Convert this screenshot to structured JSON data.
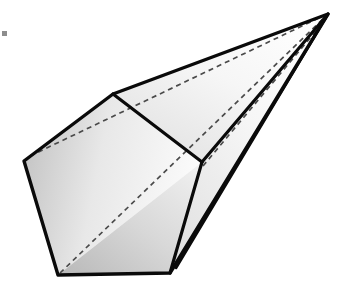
{
  "figure": {
    "background_color": "#ffffff",
    "stroke_color": "#000000",
    "hidden_edge_color": "#4a4a4a",
    "fill_light": "#fefefe",
    "fill_mid": "#e2e2e2",
    "fill_dark": "#c9c9c9",
    "stroke_width": 3,
    "hidden_stroke_width": 1.6,
    "hidden_dash_pattern": "5,4",
    "vertices": {
      "apex": [
        328,
        14
      ],
      "ridge_bend": [
        113,
        94
      ],
      "mid_right": [
        202,
        162
      ],
      "left_corner": [
        24,
        161
      ],
      "bottom_left": [
        58,
        275
      ],
      "bottom_right": [
        170,
        273
      ],
      "upper_left_dash": [
        30,
        154
      ],
      "sliver_tip": [
        176,
        268
      ]
    },
    "faces": [
      {
        "name": "top-left-face",
        "points": "113,94 24,161 30,154 113,94",
        "shade": "mid"
      },
      {
        "name": "upper-long-face",
        "points": "328,14 113,94 202,162",
        "shade": "light"
      },
      {
        "name": "left-quad-face",
        "points": "24,161 113,94 202,162 58,275",
        "shade": "mid"
      },
      {
        "name": "bottom-face",
        "points": "58,275 202,162 170,273",
        "shade": "dark"
      },
      {
        "name": "right-long-face",
        "points": "202,162 328,14 170,273",
        "shade": "light"
      },
      {
        "name": "right-sliver-face",
        "points": "170,273 328,14 176,268",
        "shade": "mid"
      }
    ],
    "solid_edges": [
      {
        "name": "apex-to-ridge-bend",
        "from": [
          328,
          14
        ],
        "to": [
          113,
          94
        ]
      },
      {
        "name": "ridge-bend-to-left-corner",
        "from": [
          113,
          94
        ],
        "to": [
          24,
          161
        ]
      },
      {
        "name": "left-corner-to-bottom-left",
        "from": [
          24,
          161
        ],
        "to": [
          58,
          275
        ]
      },
      {
        "name": "bottom-left-to-bottom-right",
        "from": [
          58,
          275
        ],
        "to": [
          170,
          273
        ]
      },
      {
        "name": "ridge-bend-to-mid-right",
        "from": [
          113,
          94
        ],
        "to": [
          202,
          162
        ]
      },
      {
        "name": "mid-right-to-bottom-right",
        "from": [
          202,
          162
        ],
        "to": [
          170,
          273
        ]
      },
      {
        "name": "mid-right-to-apex",
        "from": [
          202,
          162
        ],
        "to": [
          328,
          14
        ]
      },
      {
        "name": "bottom-right-to-apex",
        "from": [
          170,
          273
        ],
        "to": [
          328,
          14
        ]
      },
      {
        "name": "sliver-tip-to-apex",
        "from": [
          176,
          268
        ],
        "to": [
          328,
          14
        ]
      }
    ],
    "hidden_edges": [
      {
        "name": "left-corner-to-apex-hidden",
        "from": [
          30,
          155
        ],
        "to": [
          328,
          14
        ]
      },
      {
        "name": "bottom-left-to-apex-hidden",
        "from": [
          58,
          274
        ],
        "to": [
          328,
          14
        ]
      },
      {
        "name": "mid-right-to-apex-hidden",
        "from": [
          202,
          164
        ],
        "to": [
          328,
          16
        ]
      }
    ],
    "artifact": {
      "name": "corner-speck",
      "x": 2,
      "y": 31,
      "size": 5,
      "color": "#8d8d8d"
    }
  }
}
